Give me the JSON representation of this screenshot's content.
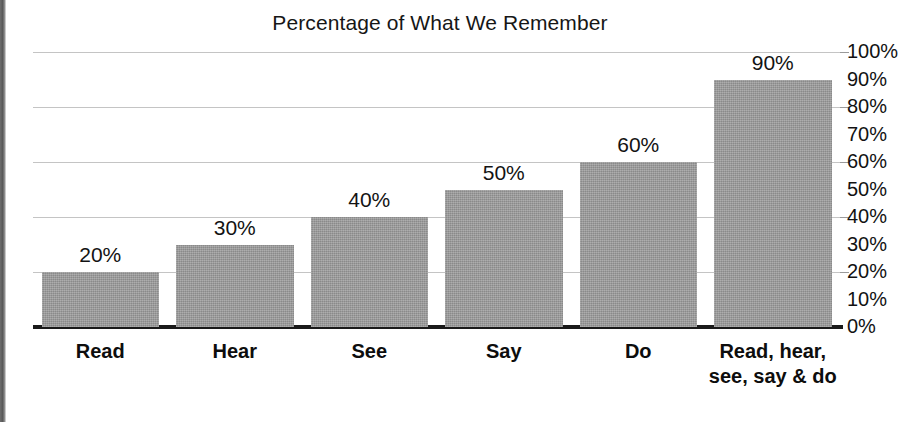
{
  "chart_data": {
    "type": "bar",
    "title": "Percentage of What We Remember",
    "xlabel": "",
    "ylabel": "",
    "ylim": [
      0,
      100
    ],
    "grid": true,
    "gridline_values": [
      100,
      80,
      60,
      40,
      20
    ],
    "legend": "none",
    "yaxis_position": "right",
    "value_labels_position": "above-bar",
    "categories": [
      "Read",
      "Hear",
      "See",
      "Say",
      "Do",
      "Read, hear,\nsee, say & do"
    ],
    "values": [
      20,
      30,
      40,
      50,
      60,
      90
    ],
    "value_labels": [
      "20%",
      "30%",
      "40%",
      "50%",
      "60%",
      "90%"
    ],
    "ytick_labels": [
      "100%",
      "90%",
      "80%",
      "70%",
      "60%",
      "50%",
      "40%",
      "30%",
      "20%",
      "10%",
      "0%"
    ],
    "ytick_values": [
      100,
      90,
      80,
      70,
      60,
      50,
      40,
      30,
      20,
      10,
      0
    ],
    "colors": {
      "bar_fill": "#9b9b9b",
      "gridline": "#c4c4c4",
      "axis": "#1a1a1a",
      "text": "#121212",
      "background": "#ffffff"
    }
  }
}
